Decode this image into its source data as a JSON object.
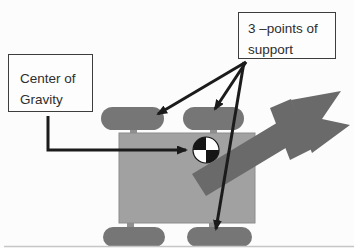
{
  "diagram": {
    "type": "vehicle-stability-diagram",
    "labels": {
      "center_of_gravity": {
        "line1": "Center of",
        "line2": "Gravity"
      },
      "points_of_support": {
        "line1": "3 –points of",
        "line2": "support"
      }
    },
    "symbols": {
      "cg_symbol": "center-of-gravity-quartered-circle",
      "boom": "forklift-boom-arrow",
      "wheels": [
        "front-left",
        "front-right",
        "rear-left",
        "rear-right"
      ]
    },
    "colors": {
      "background": "#fcfcfc",
      "body": "#a1a1a1",
      "body_edge": "#8c8c8c",
      "wheel": "#767676",
      "stub": "#8f8f8f",
      "boom": "#6a6a6a",
      "arrow": "#1b1b1b",
      "box_border": "#3d3d3d",
      "box_fill": "#fdfdfd",
      "text": "#2e2e2e",
      "cg_dark": "#151515",
      "cg_light": "#ffffff",
      "baseline": "#c6c6c6"
    }
  }
}
